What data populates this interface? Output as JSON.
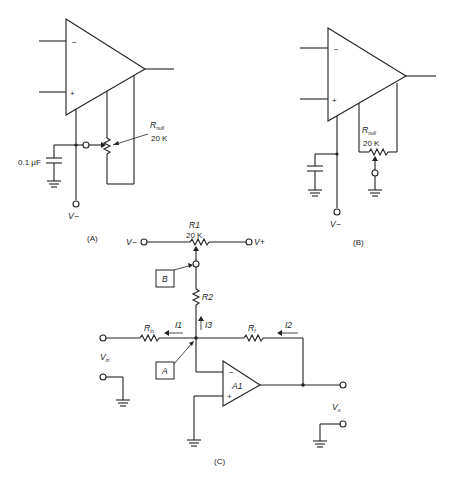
{
  "diagram": {
    "panel_a": {
      "caption": "(A)",
      "opamp": {
        "minus_sign": "−",
        "plus_sign": "+"
      },
      "pot": {
        "label_main": "R",
        "label_sub": "null",
        "value": "20 K"
      },
      "capacitor": {
        "value": "0.1 μF"
      },
      "supply": "V−"
    },
    "panel_b": {
      "caption": "(B)",
      "opamp": {
        "minus_sign": "−",
        "plus_sign": "+"
      },
      "pot": {
        "label_main": "R",
        "label_sub": "null",
        "value": "20 K"
      },
      "supply": "V−"
    },
    "panel_c": {
      "caption": "(C)",
      "r1": {
        "label": "R1",
        "value": "20 K"
      },
      "v_minus": "V−",
      "v_plus": "V+",
      "r2": "R2",
      "node_b": "B",
      "node_a": "A",
      "rin": {
        "main": "R",
        "sub": "in"
      },
      "rf": {
        "main": "R",
        "sub": "f"
      },
      "currents": {
        "i1": "I1",
        "i2": "I2",
        "i3": "I3"
      },
      "opamp": {
        "label": "A1",
        "minus_sign": "−",
        "plus_sign": "+"
      },
      "vin": {
        "main": "V",
        "sub": "in"
      },
      "vo": {
        "main": "V",
        "sub": "o"
      }
    }
  }
}
